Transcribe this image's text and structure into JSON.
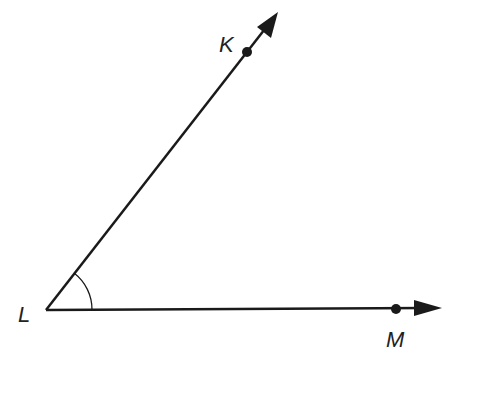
{
  "diagram": {
    "colors": {
      "line": "#1a1a1a",
      "label": "#222222",
      "background": "#ffffff"
    },
    "vertex": {
      "name": "L",
      "label": "L",
      "x": 46,
      "y": 310,
      "label_x": 18,
      "label_y": 322
    },
    "points": [
      {
        "name": "K",
        "label": "K",
        "x": 247,
        "y": 52,
        "label_x": 219,
        "label_y": 52
      },
      {
        "name": "M",
        "label": "M",
        "x": 396,
        "y": 309,
        "label_x": 386,
        "label_y": 347
      }
    ],
    "rays": [
      {
        "name": "ray-LK",
        "from": "L",
        "through": "K",
        "end_x": 278,
        "end_y": 12
      },
      {
        "name": "ray-LM",
        "from": "L",
        "through": "M",
        "end_x": 442,
        "end_y": 308
      }
    ],
    "angle_arc": {
      "vertex": "L",
      "radius": 46
    }
  }
}
